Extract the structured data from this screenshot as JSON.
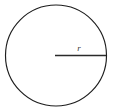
{
  "figure": {
    "name": "circle-with-radius",
    "caption": "",
    "background_color": "#ffffff",
    "width": 113,
    "height": 112
  },
  "circle": {
    "name": "circle-outline",
    "center_x": 56,
    "center_y": 55.5,
    "radius": 50.5,
    "stroke_color": "#1d1d1d",
    "stroke_width": 1.15,
    "fill": "none"
  },
  "radius": {
    "name": "radius-segment",
    "label": "r",
    "start_x": 55,
    "start_y": 55.5,
    "end_x": 106,
    "end_y": 55.5,
    "stroke_color": "#2a2a2a",
    "stroke_width": 1.6,
    "label_x": 79,
    "label_y": 51,
    "label_color": "#3a3a3a",
    "label_font_size": 9
  },
  "chart_data": {
    "type": "diagram",
    "title": "",
    "shapes": [
      {
        "kind": "circle",
        "label": "",
        "cx": 56,
        "cy": 55.5,
        "r": 50.5
      },
      {
        "kind": "segment",
        "label": "r",
        "x1": 55,
        "y1": 55.5,
        "x2": 106,
        "y2": 55.5,
        "length_px": 51
      }
    ],
    "annotations": [
      "r"
    ]
  }
}
